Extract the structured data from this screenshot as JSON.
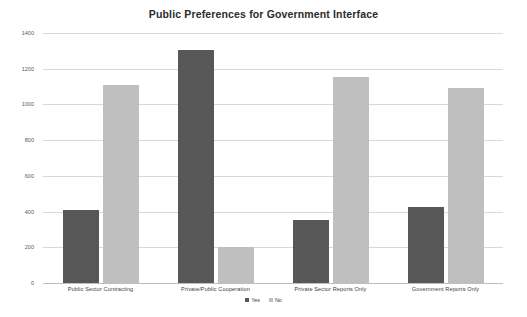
{
  "chart_data": {
    "type": "bar",
    "title": "Public Preferences for Government Interface",
    "xlabel": "",
    "ylabel": "",
    "ylim": [
      0,
      1400
    ],
    "yticks": [
      0,
      200,
      400,
      600,
      800,
      1000,
      1200,
      1400
    ],
    "grid": true,
    "legend_position": "bottom",
    "categories": [
      "Public Sector Contracting",
      "Private/Public Cooperation",
      "Private Sector Reports Only",
      "Government Reports Only"
    ],
    "series": [
      {
        "name": "Yes",
        "color": "#575757",
        "values": [
          410,
          1305,
          355,
          425
        ]
      },
      {
        "name": "No",
        "color": "#bfbfbf",
        "values": [
          1110,
          200,
          1155,
          1090
        ]
      }
    ]
  },
  "colors": {
    "background": "#ffffff",
    "title": "#2b2b2b",
    "gridline": "#d9d9d9",
    "baseline": "#bfbfbf",
    "tick_text": "#595959",
    "label_text": "#404040",
    "series_yes": "#575757",
    "series_no": "#bfbfbf"
  }
}
